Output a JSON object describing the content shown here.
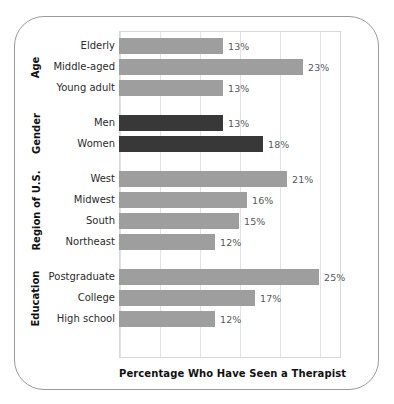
{
  "chart_data": {
    "type": "bar",
    "orientation": "horizontal",
    "title": "",
    "xlabel": "Percentage Who Have Seen a Therapist",
    "ylabel": "",
    "xlim": [
      0,
      27.75
    ],
    "xticks": [
      0,
      5,
      10,
      15,
      20,
      25
    ],
    "grid": "vertical",
    "legend": "none",
    "value_suffix": "%",
    "groups": [
      {
        "name": "Age",
        "categories": [
          "Elderly",
          "Middle-aged",
          "Young adult"
        ],
        "values": [
          13,
          23,
          13
        ],
        "labels": [
          "13%",
          "23%",
          "13%"
        ],
        "color": "#9e9e9e"
      },
      {
        "name": "Gender",
        "categories": [
          "Men",
          "Women"
        ],
        "values": [
          13,
          18
        ],
        "labels": [
          "13%",
          "18%"
        ],
        "color": "#383838"
      },
      {
        "name": "Region of U.S.",
        "categories": [
          "West",
          "Midwest",
          "South",
          "Northeast"
        ],
        "values": [
          21,
          16,
          15,
          12
        ],
        "labels": [
          "21%",
          "16%",
          "15%",
          "12%"
        ],
        "color": "#9e9e9e"
      },
      {
        "name": "Education",
        "categories": [
          "Postgraduate",
          "College",
          "High school"
        ],
        "values": [
          25,
          17,
          12
        ],
        "labels": [
          "25%",
          "17%",
          "12%"
        ],
        "color": "#9e9e9e"
      }
    ],
    "categories": [
      "Elderly",
      "Middle-aged",
      "Young adult",
      "Men",
      "Women",
      "West",
      "Midwest",
      "South",
      "Northeast",
      "Postgraduate",
      "College",
      "High school"
    ],
    "values": [
      13,
      23,
      13,
      13,
      18,
      21,
      16,
      15,
      12,
      25,
      17,
      12
    ]
  },
  "colors": {
    "bar_gray": "#9e9e9e",
    "bar_dark": "#383838",
    "gridline": "#e2e2e2",
    "plot_border": "#d9d9d9",
    "frame_border": "#9a9a9a",
    "value_text": "#55595c",
    "label_text": "#2b2b2b",
    "background": "#ffffff"
  }
}
